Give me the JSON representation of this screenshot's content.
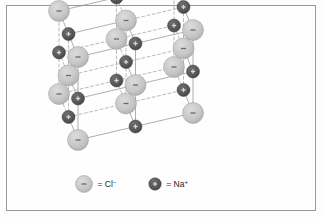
{
  "figure": {
    "border_color": "#9a9a9a",
    "background_color": "#fefefe"
  },
  "legend": {
    "items": [
      {
        "id": "chloride",
        "marker": "chloride-sphere",
        "equals": "=",
        "species": "Cl",
        "charge": "–",
        "label": "= Cl–",
        "color": "#c8c8c8",
        "sign": "–"
      },
      {
        "id": "sodium",
        "marker": "sodium-sphere",
        "equals": "=",
        "species": "Na",
        "charge": "+",
        "label": "= Na+",
        "color": "#5a5a5a",
        "sign": "+"
      }
    ]
  },
  "chart_data": {
    "type": "scatter",
    "subtitle": "Face-centred cubic rock-salt structure, 3 × 3 × 3 ions",
    "projection": "oblique cabinet",
    "grid": true,
    "xlabel": "",
    "ylabel": "",
    "lattice": {
      "dimensions": [
        3,
        3,
        3
      ],
      "origin_px": [
        78,
        140
      ],
      "axis_x_px": [
        57.5,
        -13.5
      ],
      "axis_y_px": [
        0,
        -41.5
      ],
      "axis_z_px": [
        -9.5,
        -23.0
      ],
      "cl_radius_px": 10.5,
      "na_radius_px": 6.5,
      "cl_color": "#c8c8c8",
      "cl_stroke": "#9b9b9b",
      "na_color": "#585858",
      "na_stroke": "#3a3a3a",
      "bond_color": "#8c8c8c",
      "bond_width": 0.7,
      "hidden_bond_dash": "3,2.4"
    },
    "ions": [
      {
        "species": "Cl",
        "charge": "-",
        "i": 0,
        "j": 0,
        "k": 0
      },
      {
        "species": "Na",
        "charge": "+",
        "i": 1,
        "j": 0,
        "k": 0
      },
      {
        "species": "Cl",
        "charge": "-",
        "i": 2,
        "j": 0,
        "k": 0
      },
      {
        "species": "Na",
        "charge": "+",
        "i": 0,
        "j": 1,
        "k": 0
      },
      {
        "species": "Cl",
        "charge": "-",
        "i": 1,
        "j": 1,
        "k": 0
      },
      {
        "species": "Na",
        "charge": "+",
        "i": 2,
        "j": 1,
        "k": 0
      },
      {
        "species": "Cl",
        "charge": "-",
        "i": 0,
        "j": 2,
        "k": 0
      },
      {
        "species": "Na",
        "charge": "+",
        "i": 1,
        "j": 2,
        "k": 0
      },
      {
        "species": "Cl",
        "charge": "-",
        "i": 2,
        "j": 2,
        "k": 0
      },
      {
        "species": "Na",
        "charge": "+",
        "i": 0,
        "j": 0,
        "k": 1
      },
      {
        "species": "Cl",
        "charge": "-",
        "i": 1,
        "j": 0,
        "k": 1
      },
      {
        "species": "Na",
        "charge": "+",
        "i": 2,
        "j": 0,
        "k": 1
      },
      {
        "species": "Cl",
        "charge": "-",
        "i": 0,
        "j": 1,
        "k": 1
      },
      {
        "species": "Na",
        "charge": "+",
        "i": 1,
        "j": 1,
        "k": 1
      },
      {
        "species": "Cl",
        "charge": "-",
        "i": 2,
        "j": 1,
        "k": 1
      },
      {
        "species": "Na",
        "charge": "+",
        "i": 0,
        "j": 2,
        "k": 1
      },
      {
        "species": "Cl",
        "charge": "-",
        "i": 1,
        "j": 2,
        "k": 1
      },
      {
        "species": "Na",
        "charge": "+",
        "i": 2,
        "j": 2,
        "k": 1
      },
      {
        "species": "Cl",
        "charge": "-",
        "i": 0,
        "j": 0,
        "k": 2
      },
      {
        "species": "Na",
        "charge": "+",
        "i": 1,
        "j": 0,
        "k": 2
      },
      {
        "species": "Cl",
        "charge": "-",
        "i": 2,
        "j": 0,
        "k": 2
      },
      {
        "species": "Na",
        "charge": "+",
        "i": 0,
        "j": 1,
        "k": 2
      },
      {
        "species": "Cl",
        "charge": "-",
        "i": 1,
        "j": 1,
        "k": 2
      },
      {
        "species": "Na",
        "charge": "+",
        "i": 2,
        "j": 1,
        "k": 2
      },
      {
        "species": "Cl",
        "charge": "-",
        "i": 0,
        "j": 2,
        "k": 2
      },
      {
        "species": "Na",
        "charge": "+",
        "i": 1,
        "j": 2,
        "k": 2
      },
      {
        "species": "Cl",
        "charge": "-",
        "i": 2,
        "j": 2,
        "k": 2
      }
    ],
    "counts": {
      "Cl": 14,
      "Na": 13,
      "total": 27
    }
  }
}
